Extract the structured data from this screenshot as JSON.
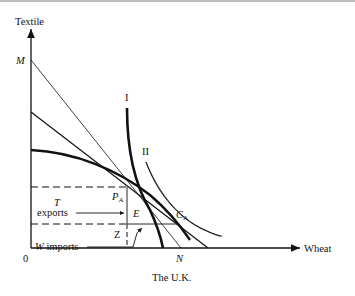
{
  "figure": {
    "caption": "The U.K.",
    "y_axis_label": "Textile",
    "x_axis_label": "Wheat",
    "origin_label": "0",
    "points": {
      "M": "M",
      "N": "N",
      "PA_main": "P",
      "PA_sub": "A",
      "CA_main": "C",
      "CA_sub": "A",
      "E": "E",
      "Z": "Z"
    },
    "curves": {
      "indifference_1": "I",
      "indifference_2": "II"
    },
    "annotations": {
      "T": "T",
      "exports": "exports",
      "W_imports": "W imports"
    }
  }
}
